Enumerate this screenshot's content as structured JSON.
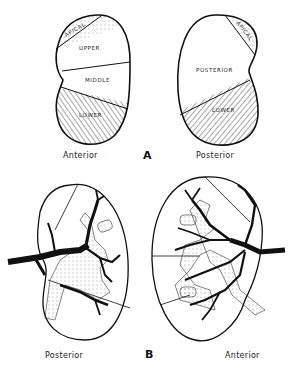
{
  "figure": {
    "panel_a": {
      "letter": "A",
      "left": {
        "caption": "Anterior",
        "segments": [
          "APICAL",
          "UPPER",
          "MIDDLE",
          "LOWER"
        ]
      },
      "right": {
        "caption": "Posterior",
        "segments": [
          "APICAL",
          "POSTERIOR",
          "LOWER"
        ]
      }
    },
    "panel_b": {
      "letter": "B",
      "left": {
        "caption": "Posterior"
      },
      "right": {
        "caption": "Anterior"
      }
    }
  },
  "colors": {
    "ink": "#111111",
    "background": "#ffffff"
  }
}
